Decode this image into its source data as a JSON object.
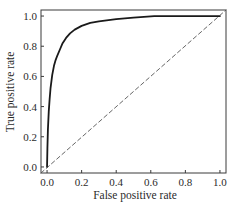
{
  "chart_data": {
    "type": "line",
    "title": "",
    "xlabel": "False positive rate",
    "ylabel": "True positive rate",
    "xlim": [
      -0.035,
      1.035
    ],
    "ylim": [
      -0.04,
      1.04
    ],
    "xticks": [
      0.0,
      0.2,
      0.4,
      0.6,
      0.8,
      1.0
    ],
    "xtick_labels": [
      "0.0",
      "0.2",
      "0.4",
      "0.6",
      "0.8",
      "1.0"
    ],
    "yticks": [
      0.0,
      0.2,
      0.4,
      0.6,
      0.8,
      1.0
    ],
    "ytick_labels": [
      "0.0",
      "0.2",
      "0.4",
      "0.6",
      "0.8",
      "1.0"
    ],
    "grid": false,
    "legend": null,
    "series": [
      {
        "name": "ROC curve",
        "style": "solid",
        "color": "#1a1a1a",
        "x": [
          0.0,
          0.002,
          0.005,
          0.01,
          0.015,
          0.02,
          0.03,
          0.04,
          0.05,
          0.06,
          0.075,
          0.09,
          0.11,
          0.133,
          0.16,
          0.2,
          0.25,
          0.3,
          0.4,
          0.5,
          0.62,
          0.75,
          0.9,
          0.98,
          1.0
        ],
        "y": [
          0.0,
          0.12,
          0.25,
          0.37,
          0.45,
          0.52,
          0.61,
          0.67,
          0.71,
          0.74,
          0.78,
          0.82,
          0.855,
          0.885,
          0.91,
          0.935,
          0.955,
          0.965,
          0.98,
          0.99,
          1.0,
          1.0,
          1.0,
          1.0,
          1.0
        ]
      },
      {
        "name": "Random classifier",
        "style": "dashed",
        "color": "#555555",
        "x": [
          -0.035,
          1.035
        ],
        "y": [
          -0.04,
          1.04
        ]
      }
    ]
  }
}
